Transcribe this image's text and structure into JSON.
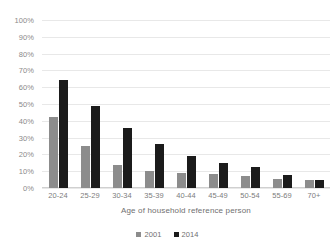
{
  "chart_data": {
    "type": "bar",
    "title": "",
    "subtitle": "",
    "xlabel": "Age of household reference person",
    "ylabel": "",
    "categories": [
      "20-24",
      "25-29",
      "30-34",
      "35-39",
      "40-44",
      "45-49",
      "50-54",
      "55-69",
      "70+"
    ],
    "series": [
      {
        "name": "2001",
        "color": "#8c8c8c",
        "values": [
          42,
          25,
          13.5,
          10,
          9,
          8.5,
          7,
          5.5,
          5
        ]
      },
      {
        "name": "2014",
        "color": "#1b1b1b",
        "values": [
          64,
          49,
          36,
          26,
          19,
          15,
          12.5,
          7.5,
          4.5
        ]
      }
    ],
    "ylim": [
      0,
      100
    ],
    "ytick_values": [
      0,
      10,
      20,
      30,
      40,
      50,
      60,
      70,
      80,
      90,
      100
    ],
    "ytick_labels": [
      "0%",
      "10%",
      "20%",
      "30%",
      "40%",
      "50%",
      "60%",
      "70%",
      "80%",
      "90%",
      "100%"
    ],
    "grid": true,
    "grid_axis": "y",
    "legend_position": "bottom",
    "value_format": "percent"
  },
  "axis": {
    "x_title": "Age of household reference person"
  },
  "legend": {
    "items": [
      {
        "label": "2001",
        "color": "#8c8c8c",
        "swatch": "square-marker-icon"
      },
      {
        "label": "2014",
        "color": "#1b1b1b",
        "swatch": "square-marker-icon"
      }
    ]
  },
  "colors": {
    "series_2001": "#8c8c8c",
    "series_2014": "#1b1b1b",
    "gridline": "#e8e8e8",
    "tick_text": "#8a8a8a",
    "background": "#ffffff"
  }
}
